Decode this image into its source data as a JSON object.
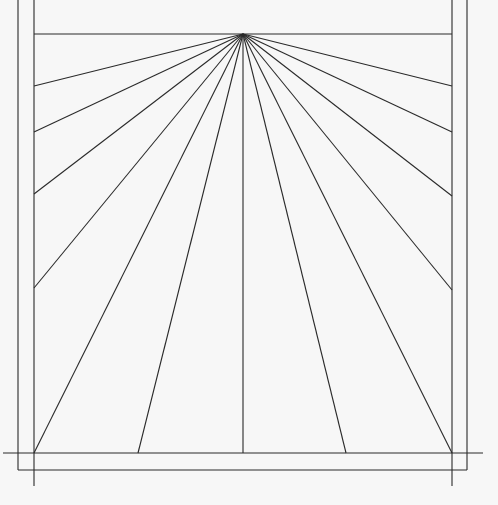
{
  "diagram": {
    "canvas": {
      "width": 498,
      "height": 505,
      "background": "#f7f7f7",
      "line_color": "#2a2a2a"
    },
    "outer_frame": {
      "left": 18,
      "right": 467,
      "top": -2,
      "bottom": 470
    },
    "inner_frame": {
      "left": 34,
      "right": 452,
      "top": 34,
      "bottom": 453
    },
    "baseline": {
      "x1": 3,
      "x2": 483,
      "y": 453
    },
    "corner_verticals": [
      {
        "x": 34,
        "y1": 453,
        "y2": 486
      },
      {
        "x": 452,
        "y1": 453,
        "y2": 486
      }
    ],
    "gnomon_root": {
      "x": 243,
      "y": 34
    },
    "hour_line_endpoints": [
      {
        "x": 34,
        "y": 86
      },
      {
        "x": 34,
        "y": 132
      },
      {
        "x": 34,
        "y": 194
      },
      {
        "x": 34,
        "y": 288
      },
      {
        "x": 34,
        "y": 453
      },
      {
        "x": 138,
        "y": 453
      },
      {
        "x": 243,
        "y": 453
      },
      {
        "x": 346,
        "y": 453
      },
      {
        "x": 452,
        "y": 453
      },
      {
        "x": 452,
        "y": 290
      },
      {
        "x": 452,
        "y": 196
      },
      {
        "x": 452,
        "y": 132
      },
      {
        "x": 452,
        "y": 86
      }
    ]
  }
}
